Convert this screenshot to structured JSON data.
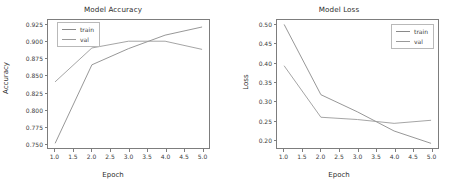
{
  "figure": {
    "width": 452,
    "height": 184,
    "background": "#ffffff"
  },
  "chart_data": [
    {
      "type": "line",
      "title": "Model Accuracy",
      "xlabel": "Epoch",
      "ylabel": "Accuracy",
      "x": [
        1.0,
        2.0,
        3.0,
        4.0,
        5.0
      ],
      "xlim": [
        0.8,
        5.2
      ],
      "ylim": [
        0.7425,
        0.9325
      ],
      "xticks": [
        "1.0",
        "1.5",
        "2.0",
        "2.5",
        "3.0",
        "3.5",
        "4.0",
        "4.5",
        "5.0"
      ],
      "xtick_values": [
        1.0,
        1.5,
        2.0,
        2.5,
        3.0,
        3.5,
        4.0,
        4.5,
        5.0
      ],
      "yticks": [
        "0.750",
        "0.775",
        "0.800",
        "0.825",
        "0.850",
        "0.875",
        "0.900",
        "0.925"
      ],
      "ytick_values": [
        0.75,
        0.775,
        0.8,
        0.825,
        0.85,
        0.875,
        0.9,
        0.925
      ],
      "grid": false,
      "legend_position": "upper left",
      "series": [
        {
          "name": "train",
          "color": "#8a8a8a",
          "values": [
            0.75,
            0.866,
            0.89,
            0.91,
            0.922
          ]
        },
        {
          "name": "val",
          "color": "#9a9a9a",
          "values": [
            0.841,
            0.891,
            0.901,
            0.901,
            0.889
          ]
        }
      ]
    },
    {
      "type": "line",
      "title": "Model Loss",
      "xlabel": "Epoch",
      "ylabel": "Loss",
      "x": [
        1.0,
        2.0,
        3.0,
        4.0,
        5.0
      ],
      "xlim": [
        0.8,
        5.2
      ],
      "ylim": [
        0.1775,
        0.5125
      ],
      "xticks": [
        "1.0",
        "1.5",
        "2.0",
        "2.5",
        "3.0",
        "3.5",
        "4.0",
        "4.5",
        "5.0"
      ],
      "xtick_values": [
        1.0,
        1.5,
        2.0,
        2.5,
        3.0,
        3.5,
        4.0,
        4.5,
        5.0
      ],
      "yticks": [
        "0.50",
        "0.45",
        "0.40",
        "0.35",
        "0.30",
        "0.25",
        "0.20"
      ],
      "ytick_values": [
        0.5,
        0.45,
        0.4,
        0.35,
        0.3,
        0.25,
        0.2
      ],
      "grid": false,
      "legend_position": "upper right",
      "series": [
        {
          "name": "train",
          "color": "#8a8a8a",
          "values": [
            0.5,
            0.317,
            0.272,
            0.222,
            0.19
          ]
        },
        {
          "name": "val",
          "color": "#9a9a9a",
          "values": [
            0.392,
            0.258,
            0.252,
            0.242,
            0.25
          ]
        }
      ]
    }
  ]
}
